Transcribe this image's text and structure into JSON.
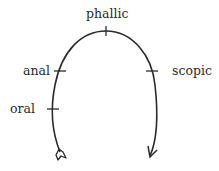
{
  "diagram": {
    "type": "drive-circuit",
    "stroke_color": "#2a2a2a",
    "labels": {
      "phallic": "phallic",
      "anal": "anal",
      "oral": "oral",
      "scopic": "scopic"
    },
    "start_marker": "tail-feather",
    "end_marker": "arrowhead"
  }
}
